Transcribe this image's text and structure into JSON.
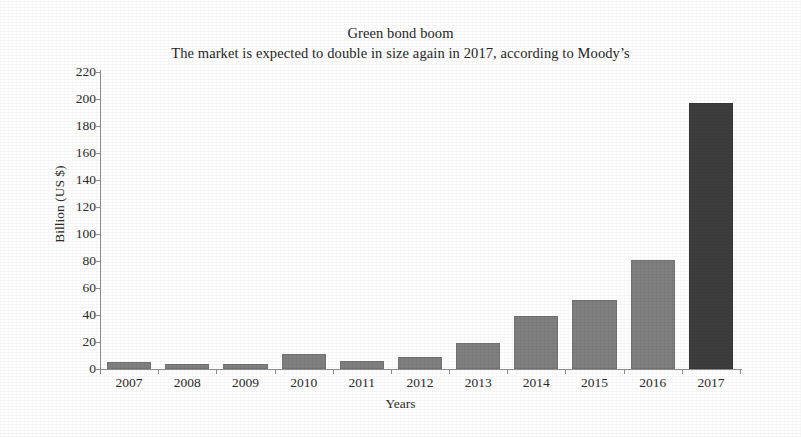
{
  "chart_data": {
    "type": "bar",
    "title": "Green bond boom",
    "subtitle": "The market is expected to double in size again in 2017, according to Moody’s",
    "xlabel": "Years",
    "ylabel": "Billion (US $)",
    "categories": [
      "2007",
      "2008",
      "2009",
      "2010",
      "2011",
      "2012",
      "2013",
      "2014",
      "2015",
      "2016",
      "2017"
    ],
    "values": [
      5,
      4,
      4,
      11,
      6,
      9,
      19,
      39,
      51,
      81,
      197
    ],
    "ylim": [
      0,
      220
    ],
    "ytick_values": [
      0,
      20,
      40,
      60,
      80,
      100,
      120,
      140,
      160,
      180,
      200,
      220
    ],
    "ytick_labels": [
      "0",
      "20",
      "40",
      "60",
      "80",
      "100",
      "120",
      "140",
      "160",
      "180",
      "200",
      "220"
    ],
    "grid": false,
    "legend": false,
    "series": [
      {
        "name": "Green bond issuance",
        "values": [
          5,
          4,
          4,
          11,
          6,
          9,
          19,
          39,
          51,
          81,
          197
        ]
      }
    ],
    "bar_colors": [
      "#808080",
      "#808080",
      "#808080",
      "#808080",
      "#808080",
      "#808080",
      "#808080",
      "#808080",
      "#808080",
      "#808080",
      "#3d3d3d"
    ],
    "forecast_category": "2017",
    "colors": {
      "bar": "#808080",
      "bar_forecast": "#3d3d3d",
      "axis": "#8f8f8f",
      "text": "#2b2b2b",
      "background": "#ffffff"
    }
  }
}
